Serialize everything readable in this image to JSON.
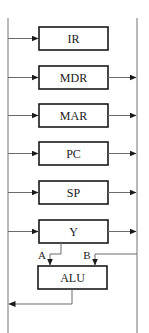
{
  "diagram": {
    "type": "cpu-datapath-block-diagram",
    "buses": {
      "left": {
        "x": 8,
        "y1": 18,
        "y2": 333
      },
      "right": {
        "x": 137,
        "y1": 18,
        "y2": 333
      }
    },
    "registers": [
      {
        "label": "IR",
        "y": 27,
        "input_from_left": true,
        "output_to_right": false
      },
      {
        "label": "MDR",
        "y": 66,
        "input_from_left": true,
        "output_to_right": true
      },
      {
        "label": "MAR",
        "y": 104,
        "input_from_left": true,
        "output_to_right": true
      },
      {
        "label": "PC",
        "y": 142,
        "input_from_left": true,
        "output_to_right": true
      },
      {
        "label": "SP",
        "y": 181,
        "input_from_left": true,
        "output_to_right": true
      },
      {
        "label": "Y",
        "y": 220,
        "input_from_left": true,
        "output_to_right": true
      }
    ],
    "alu": {
      "label": "ALU",
      "port_a_label": "A",
      "port_b_label": "B",
      "port_a_source": "Y",
      "port_b_source": "right-bus",
      "output_to": "left-bus"
    }
  }
}
